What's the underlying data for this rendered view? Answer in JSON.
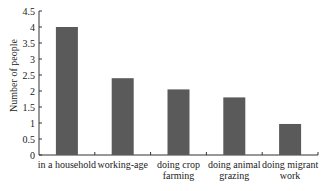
{
  "chart_data": {
    "type": "bar",
    "title": "",
    "xlabel": "",
    "ylabel": "Number of people",
    "ylim": [
      0,
      4.5
    ],
    "yticks": [
      "0",
      "0.5",
      "1",
      "1.5",
      "2",
      "2.5",
      "3",
      "3.5",
      "4",
      "4.5"
    ],
    "categories": [
      "in a household",
      "working-age",
      "doing crop farming",
      "doing animal grazing",
      "doing migrant work"
    ],
    "category_lines": [
      [
        "in a household"
      ],
      [
        "working-age"
      ],
      [
        "doing crop",
        "farming"
      ],
      [
        "doing animal",
        "grazing"
      ],
      [
        "doing migrant",
        "work"
      ]
    ],
    "values": [
      4.0,
      2.4,
      2.05,
      1.8,
      0.97
    ],
    "grid": false,
    "legend": null,
    "bar_color": "#5a5a5a"
  }
}
